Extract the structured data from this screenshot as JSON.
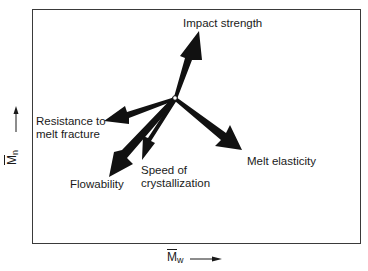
{
  "diagram": {
    "center": {
      "x": 175,
      "y": 98
    },
    "arrows": [
      {
        "id": "impact-strength",
        "label": "Impact strength",
        "tip": {
          "x": 199,
          "y": 31
        }
      },
      {
        "id": "resistance-to-melt-fracture",
        "label": "Resistance to\nmelt fracture",
        "tip": {
          "x": 104,
          "y": 121
        }
      },
      {
        "id": "flowability",
        "label": "Flowability",
        "tip": {
          "x": 109,
          "y": 177
        }
      },
      {
        "id": "speed-of-crystallization",
        "label": "Speed of\ncrystallization",
        "tip": {
          "x": 142,
          "y": 160
        }
      },
      {
        "id": "melt-elasticity",
        "label": "Melt elasticity",
        "tip": {
          "x": 242,
          "y": 150
        }
      }
    ],
    "x_axis": {
      "symbol": "M",
      "subscript": "w",
      "direction": "increasing →"
    },
    "y_axis": {
      "symbol": "M",
      "subscript": "n",
      "direction": "increasing ↑"
    }
  },
  "labels": {
    "impact_strength": "Impact strength",
    "resistance": "Resistance to\nmelt fracture",
    "flowability": "Flowability",
    "speed": "Speed of\ncrystallization",
    "melt_elasticity": "Melt elasticity"
  },
  "axes": {
    "x_symbol": "M",
    "x_sub": "w",
    "y_symbol": "M",
    "y_sub": "n"
  },
  "colors": {
    "arrow_fill": "#111111",
    "frame": "#3a3a3a",
    "text": "#1a1a1a",
    "background": "#ffffff"
  }
}
